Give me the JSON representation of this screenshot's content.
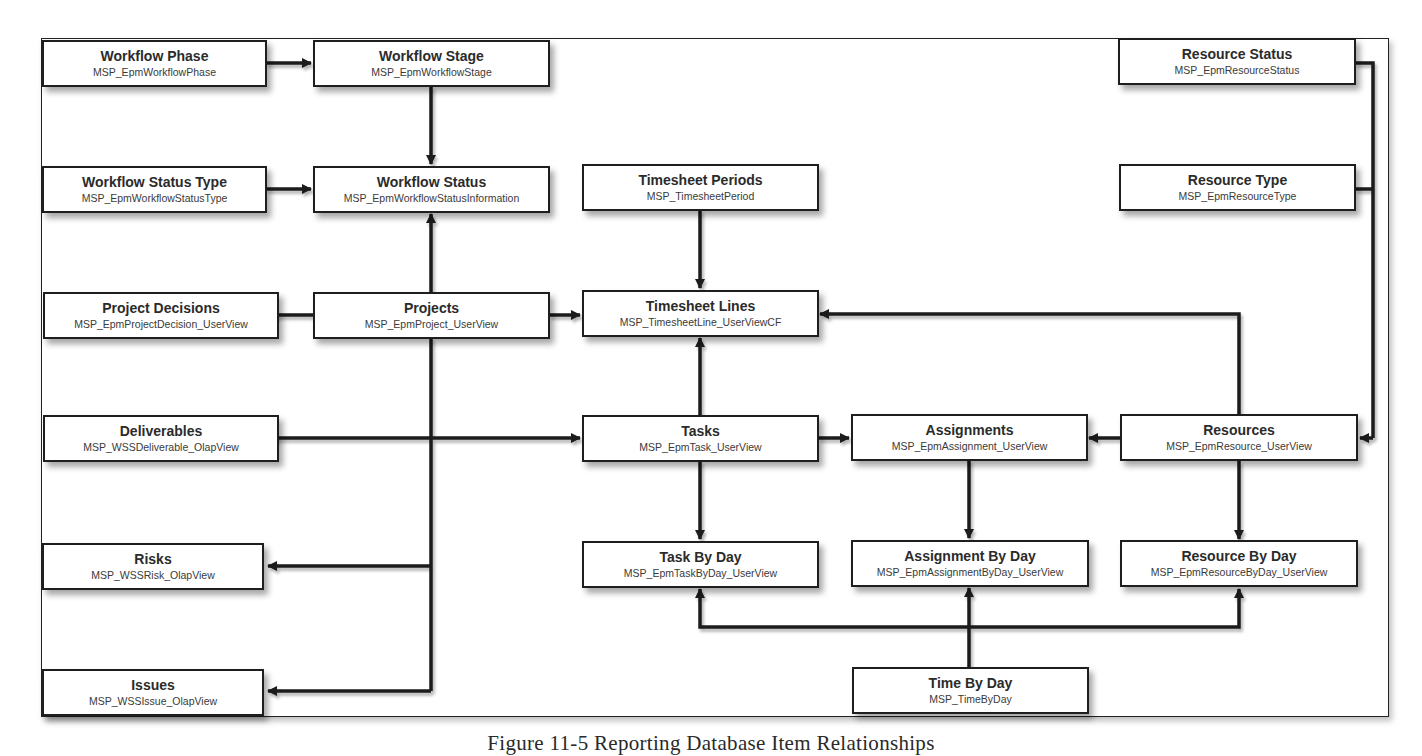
{
  "diagram": {
    "caption": "Figure 11-5 Reporting Database Item Relationships",
    "boxes": {
      "workflow_phase": {
        "title": "Workflow Phase",
        "table": "MSP_EpmWorkflowPhase"
      },
      "workflow_stage": {
        "title": "Workflow Stage",
        "table": "MSP_EpmWorkflowStage"
      },
      "workflow_status_type": {
        "title": "Workflow Status Type",
        "table": "MSP_EpmWorkflowStatusType"
      },
      "workflow_status": {
        "title": "Workflow Status",
        "table": "MSP_EpmWorkflowStatusInformation"
      },
      "timesheet_periods": {
        "title": "Timesheet Periods",
        "table": "MSP_TimesheetPeriod"
      },
      "resource_status": {
        "title": "Resource Status",
        "table": "MSP_EpmResourceStatus"
      },
      "resource_type": {
        "title": "Resource Type",
        "table": "MSP_EpmResourceType"
      },
      "project_decisions": {
        "title": "Project Decisions",
        "table": "MSP_EpmProjectDecision_UserView"
      },
      "projects": {
        "title": "Projects",
        "table": "MSP_EpmProject_UserView"
      },
      "timesheet_lines": {
        "title": "Timesheet Lines",
        "table": "MSP_TimesheetLine_UserViewCF"
      },
      "deliverables": {
        "title": "Deliverables",
        "table": "MSP_WSSDeliverable_OlapView"
      },
      "tasks": {
        "title": "Tasks",
        "table": "MSP_EpmTask_UserView"
      },
      "assignments": {
        "title": "Assignments",
        "table": "MSP_EpmAssignment_UserView"
      },
      "resources": {
        "title": "Resources",
        "table": "MSP_EpmResource_UserView"
      },
      "risks": {
        "title": "Risks",
        "table": "MSP_WSSRisk_OlapView"
      },
      "task_by_day": {
        "title": "Task By Day",
        "table": "MSP_EpmTaskByDay_UserView"
      },
      "assignment_by_day": {
        "title": "Assignment By Day",
        "table": "MSP_EpmAssignmentByDay_UserView"
      },
      "resource_by_day": {
        "title": "Resource By Day",
        "table": "MSP_EpmResourceByDay_UserView"
      },
      "issues": {
        "title": "Issues",
        "table": "MSP_WSSIssue_OlapView"
      },
      "time_by_day": {
        "title": "Time By Day",
        "table": "MSP_TimeByDay"
      }
    },
    "relationships": [
      {
        "from": "Workflow Phase",
        "to": "Workflow Stage"
      },
      {
        "from": "Workflow Stage",
        "to": "Workflow Status"
      },
      {
        "from": "Workflow Status Type",
        "to": "Workflow Status"
      },
      {
        "from": "Projects",
        "to": "Workflow Status"
      },
      {
        "from": "Projects",
        "to": "Project Decisions"
      },
      {
        "from": "Projects",
        "to": "Timesheet Lines"
      },
      {
        "from": "Projects",
        "to": "Deliverables"
      },
      {
        "from": "Projects",
        "to": "Tasks"
      },
      {
        "from": "Projects",
        "to": "Risks"
      },
      {
        "from": "Projects",
        "to": "Issues"
      },
      {
        "from": "Timesheet Periods",
        "to": "Timesheet Lines"
      },
      {
        "from": "Tasks",
        "to": "Timesheet Lines"
      },
      {
        "from": "Tasks",
        "to": "Assignments"
      },
      {
        "from": "Tasks",
        "to": "Task By Day"
      },
      {
        "from": "Resources",
        "to": "Assignments"
      },
      {
        "from": "Resources",
        "to": "Timesheet Lines"
      },
      {
        "from": "Resources",
        "to": "Resource By Day"
      },
      {
        "from": "Resource Status",
        "to": "Resources"
      },
      {
        "from": "Resource Type",
        "to": "Resources"
      },
      {
        "from": "Assignments",
        "to": "Assignment By Day"
      },
      {
        "from": "Time By Day",
        "to": "Task By Day"
      },
      {
        "from": "Time By Day",
        "to": "Assignment By Day"
      },
      {
        "from": "Time By Day",
        "to": "Resource By Day"
      }
    ],
    "colors": {
      "line": "#1e1e1e",
      "box_fill": "#ffffff",
      "text": "#2b2b2b"
    }
  }
}
